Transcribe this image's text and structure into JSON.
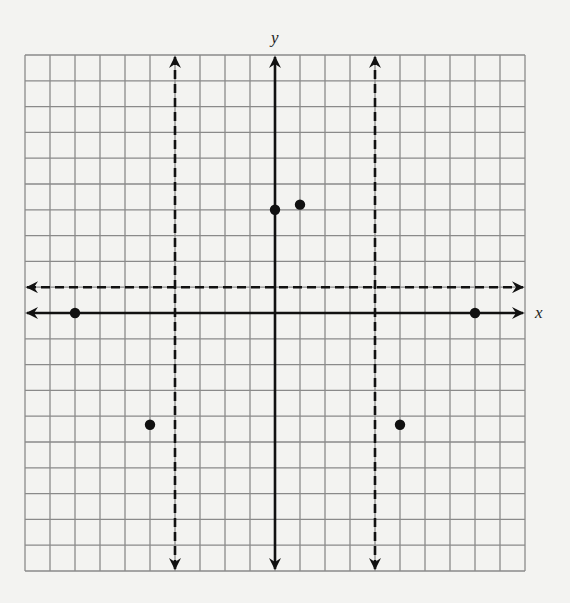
{
  "chart_data": {
    "type": "scatter",
    "title": "",
    "xlabel": "x",
    "ylabel": "y",
    "xlim": [
      -10,
      10
    ],
    "ylim": [
      -10,
      10
    ],
    "grid": true,
    "grid_step": 1,
    "tick_labels": [],
    "legend": null,
    "axes": {
      "x_axis": {
        "style": "solid",
        "label": "x",
        "arrows": "both"
      },
      "y_axis": {
        "style": "solid",
        "label": "y",
        "arrows": "both"
      }
    },
    "asymptotes": [
      {
        "type": "vertical",
        "x": -4,
        "style": "dashed",
        "arrows": "both"
      },
      {
        "type": "vertical",
        "x": 4,
        "style": "dashed",
        "arrows": "both"
      },
      {
        "type": "horizontal",
        "y": 1,
        "style": "dashed",
        "arrows": "both"
      }
    ],
    "points": [
      {
        "x": -8,
        "y": 0
      },
      {
        "x": 8,
        "y": 0
      },
      {
        "x": 0,
        "y": 4
      },
      {
        "x": 1,
        "y": 4.2
      },
      {
        "x": -5,
        "y": -4.33
      },
      {
        "x": 5,
        "y": -4.33
      }
    ]
  },
  "colors": {
    "background": "#f3f3f1",
    "grid": "#8a8a8a",
    "axis": "#111111",
    "points": "#111111"
  },
  "labels": {
    "x_axis": "x",
    "y_axis": "y"
  }
}
